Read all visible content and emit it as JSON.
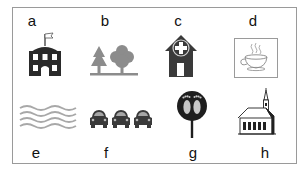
{
  "figure": {
    "items": [
      {
        "letter": "a",
        "icon": "school-building-icon",
        "meaning": "school"
      },
      {
        "letter": "b",
        "icon": "trees-icon",
        "meaning": "park / woodland"
      },
      {
        "letter": "c",
        "icon": "hospital-house-icon",
        "meaning": "hospital / clinic"
      },
      {
        "letter": "d",
        "icon": "coffee-cup-icon",
        "meaning": "cafe"
      },
      {
        "letter": "e",
        "icon": "water-waves-icon",
        "meaning": "water / river"
      },
      {
        "letter": "f",
        "icon": "cars-icon",
        "meaning": "traffic / parking"
      },
      {
        "letter": "g",
        "icon": "footprints-sign-icon",
        "meaning": "footpath / walking route"
      },
      {
        "letter": "h",
        "icon": "church-icon",
        "meaning": "church"
      }
    ],
    "colors": {
      "border": "#9a9a9a",
      "dark_icon": "#2a2a2a",
      "gray_icon": "#8c8c8c",
      "wave": "#a8a8a8"
    }
  }
}
